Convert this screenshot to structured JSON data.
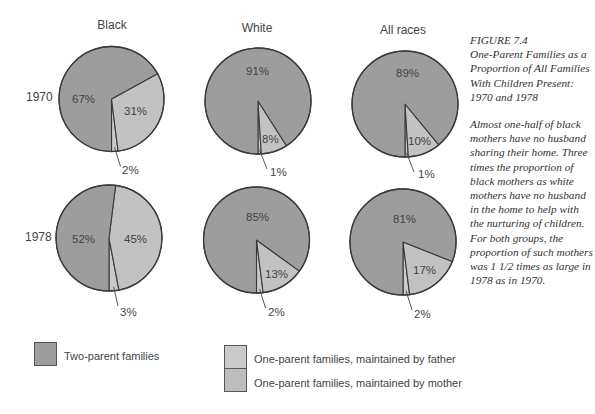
{
  "chart_data": {
    "type": "pie",
    "title": "FIGURE 7.4 One-Parent Families as a Proportion of All Families With Children Present: 1970 and 1978",
    "columns": [
      "Black",
      "White",
      "All races"
    ],
    "rows": [
      "1970",
      "1978"
    ],
    "categories": [
      "Two-parent families",
      "One-parent families, maintained by father",
      "One-parent families, maintained by mother"
    ],
    "series": [
      {
        "name": "Black 1970",
        "group": "Black",
        "year": "1970",
        "values": [
          67,
          2,
          31
        ]
      },
      {
        "name": "White 1970",
        "group": "White",
        "year": "1970",
        "values": [
          91,
          1,
          8
        ]
      },
      {
        "name": "All races 1970",
        "group": "All races",
        "year": "1970",
        "values": [
          89,
          1,
          10
        ]
      },
      {
        "name": "Black 1978",
        "group": "Black",
        "year": "1978",
        "values": [
          52,
          3,
          45
        ]
      },
      {
        "name": "White 1978",
        "group": "White",
        "year": "1978",
        "values": [
          85,
          2,
          13
        ]
      },
      {
        "name": "All races 1978",
        "group": "All races",
        "year": "1978",
        "values": [
          81,
          2,
          17
        ]
      }
    ],
    "legend_position": "bottom",
    "colors": {
      "two_parent": "#9d9d9d",
      "father": "#cacaca",
      "mother": "#c2c2c2",
      "outline": "#3a3a3a"
    }
  },
  "headers": {
    "black": "Black",
    "white": "White",
    "all": "All races"
  },
  "rows": {
    "r1970": "1970",
    "r1978": "1978"
  },
  "pies": {
    "black_1970": {
      "two": "67%",
      "father": "2%",
      "mother": "31%"
    },
    "white_1970": {
      "two": "91%",
      "father": "1%",
      "mother": "8%"
    },
    "all_1970": {
      "two": "89%",
      "father": "1%",
      "mother": "10%"
    },
    "black_1978": {
      "two": "52%",
      "father": "3%",
      "mother": "45%"
    },
    "white_1978": {
      "two": "85%",
      "father": "2%",
      "mother": "13%"
    },
    "all_1978": {
      "two": "81%",
      "father": "2%",
      "mother": "17%"
    }
  },
  "caption": {
    "figure_number": "FIGURE 7.4",
    "title": "One-Parent Families as a Proportion of All Families With Children Present: 1970 and 1978",
    "body": "Almost one-half of black mothers have no husband sharing their home. Three times the proportion of black mothers as white mothers have no husband in the home to help with the nurturing of children. For both groups, the proportion of such mothers was 1 1/2 times as large in 1978 as in 1970."
  },
  "legend": {
    "two_parent": "Two-parent families",
    "father": "One-parent families, maintained by father",
    "mother": "One-parent families, maintained by mother"
  }
}
